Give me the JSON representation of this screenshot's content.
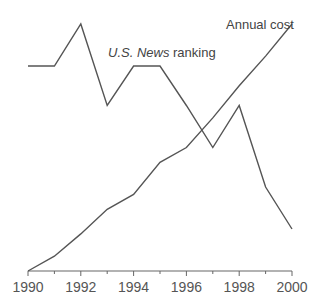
{
  "chart_data": {
    "type": "line",
    "title": "",
    "xlabel": "",
    "ylabel": "",
    "x": [
      1990,
      1991,
      1992,
      1993,
      1994,
      1995,
      1996,
      1997,
      1998,
      1999,
      2000
    ],
    "xlim": [
      1990,
      2000
    ],
    "ylim": [
      0,
      100
    ],
    "x_tick_labels": [
      "1990",
      "1992",
      "1994",
      "1996",
      "1998",
      "2000"
    ],
    "grid": false,
    "legend": "none (direct labels)",
    "series": [
      {
        "name": "U.S. News ranking",
        "name_italic": "U.S. News",
        "name_plain": " ranking",
        "values": [
          83,
          83,
          100,
          67,
          83,
          83,
          67,
          50,
          67,
          34,
          17
        ]
      },
      {
        "name": "Annual cost",
        "values": [
          0,
          6,
          15,
          25,
          31,
          44,
          50,
          62,
          75,
          87,
          100
        ]
      }
    ],
    "annotations": [
      {
        "text": "U.S. News ranking",
        "near": "1994-1995 peak"
      },
      {
        "text": "Annual cost",
        "near": "2000 end"
      }
    ]
  },
  "colors": {
    "line": "#555555",
    "axis": "#666666",
    "text": "#555555"
  }
}
